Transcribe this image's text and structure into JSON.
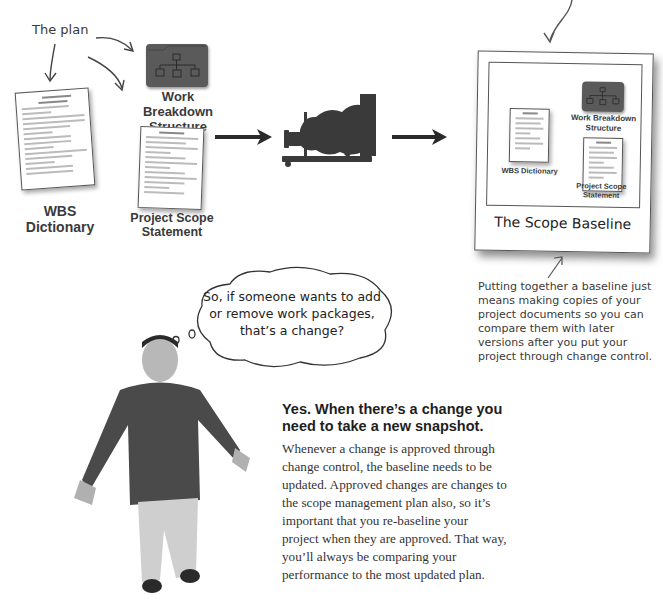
{
  "annotations": {
    "the_plan": "The plan",
    "baseline_note": "Putting together a baseline just means making copies of your project documents so you can compare them with later versions after you put your project through change control."
  },
  "plan_documents": {
    "wbs": "Work Breakdown Structure",
    "wbs_dictionary": "WBS Dictionary",
    "scope_statement": "Project Scope Statement"
  },
  "snapshot": {
    "title": "The Scope Baseline",
    "wbs": "Work Breakdown Structure",
    "wbs_dictionary": "WBS Dictionary",
    "scope_statement": "Project Scope Statement"
  },
  "thought_bubble": {
    "text": "So, if someone wants to add or remove work packages, that’s a change?"
  },
  "answer": {
    "heading": "Yes. When there’s a change you need to take a new snapshot.",
    "body": "Whenever a change is approved through change control, the baseline needs to be updated. Approved changes are changes to the scope management plan also, so it’s important that you re-baseline your project when they are approved. That way, you’ll always be comparing your performance to the most updated plan."
  },
  "icons": {
    "camera": "camera-icon",
    "folder": "folder-icon",
    "document": "document-icon",
    "person": "person-illustration"
  },
  "colors": {
    "ink": "#2a2a2a",
    "folder": "#5a5a5a",
    "handwriting": "#3a3a3a"
  }
}
